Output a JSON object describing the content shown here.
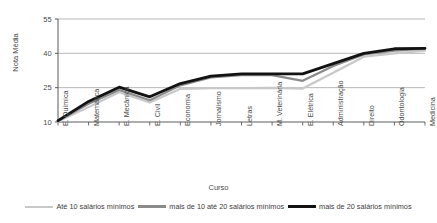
{
  "chart_data": {
    "type": "line",
    "title": "",
    "xlabel": "Curso",
    "ylabel": "Nota Média",
    "ylim": [
      10,
      55
    ],
    "yticks": [
      10,
      25,
      40,
      55
    ],
    "grid": true,
    "legend_position": "bottom",
    "categories": [
      "E. Química",
      "Matemática",
      "E. Mecânica",
      "E. Civil",
      "Economia",
      "Jornalismo",
      "Letras",
      "M. Veterinária",
      "E. Elétrica",
      "Administração",
      "Direito",
      "Odontologia",
      "Medicina"
    ],
    "series": [
      {
        "name": "Até 10 salários mínimos",
        "color": "#c8c8c8",
        "width": 2.2,
        "values": [
          10.2,
          16.5,
          23.0,
          18.5,
          24.5,
          24.8,
          24.8,
          24.9,
          24.6,
          31.5,
          38.5,
          40.0,
          41.2
        ]
      },
      {
        "name": "mais de 10 até 20 salários mínimos",
        "color": "#8a8a8a",
        "width": 2.2,
        "values": [
          10.4,
          18.0,
          24.0,
          19.5,
          26.0,
          29.5,
          30.5,
          30.5,
          28.0,
          34.5,
          39.5,
          41.2,
          42.0
        ]
      },
      {
        "name": "mais de 20 salários mínimos",
        "color": "#121212",
        "width": 2.8,
        "values": [
          10.6,
          19.0,
          25.2,
          21.0,
          26.8,
          30.0,
          31.0,
          31.0,
          31.0,
          35.5,
          40.0,
          42.0,
          42.2
        ]
      }
    ]
  },
  "axis": {
    "y_title": "Nota Média",
    "x_title": "Curso",
    "y_tick_labels": [
      "55",
      "40",
      "25",
      "10"
    ]
  },
  "legend": {
    "items": [
      {
        "label": "Até 10 salários mínimos",
        "color": "#c8c8c8",
        "width": 2.2
      },
      {
        "label": "mais de 10 até 20 salários mínimos",
        "color": "#8a8a8a",
        "width": 2.6
      },
      {
        "label": "mais de 20 salários mínimos",
        "color": "#121212",
        "width": 3.4
      }
    ]
  }
}
